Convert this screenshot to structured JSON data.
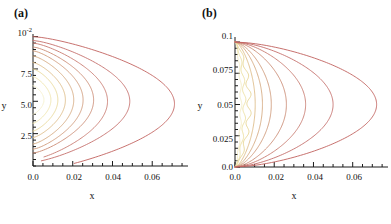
{
  "figure": {
    "panels": [
      {
        "key": "a",
        "label": "(a)",
        "xlabel": "x",
        "ylabel": "y",
        "y_exponent_label": "10",
        "y_exponent_sup": "-2",
        "x_ticks": [
          "0.0",
          "0.02",
          "0.04",
          "0.06"
        ],
        "y_ticks": [
          "7.5",
          "5.0",
          "2.5"
        ]
      },
      {
        "key": "b",
        "label": "(b)",
        "xlabel": "x",
        "ylabel": "y",
        "x_ticks": [
          "0.0",
          "0.02",
          "0.04",
          "0.06"
        ],
        "y_ticks": [
          "0.1",
          "0.075",
          "0.05",
          "0.025",
          "0.0"
        ]
      }
    ]
  },
  "chart_data": [
    {
      "type": "line",
      "title": "(a)",
      "xlabel": "x",
      "ylabel": "y",
      "xlim": [
        0.0,
        0.078
      ],
      "ylim": [
        0.0,
        0.0102
      ],
      "y_scale_note": "y axis in units of 10^-2",
      "x_ticks": [
        0.0,
        0.02,
        0.04,
        0.06
      ],
      "y_ticks": [
        0.0025,
        0.005,
        0.0075,
        0.01
      ],
      "grid": false,
      "legend": "none",
      "description": "Nested open contour curves anchored on the left axis (x=0), each bulging rightward with a rounded nose; curves grow progressively larger and change color from pale cream (innermost) to reddish brown (outermost).",
      "series": [
        {
          "name": "level-1",
          "color": "#f5efc8",
          "x_max": 0.0055,
          "y_center": 0.0051,
          "y_top": 0.0062,
          "y_bottom": 0.004
        },
        {
          "name": "level-2",
          "color": "#eee3a8",
          "x_max": 0.009,
          "y_center": 0.0051,
          "y_top": 0.0069,
          "y_bottom": 0.0033
        },
        {
          "name": "level-3",
          "color": "#e8d795",
          "x_max": 0.0125,
          "y_center": 0.0051,
          "y_top": 0.0075,
          "y_bottom": 0.0027
        },
        {
          "name": "level-4",
          "color": "#ddbb86",
          "x_max": 0.0163,
          "y_center": 0.0051,
          "y_top": 0.008,
          "y_bottom": 0.0022
        },
        {
          "name": "level-5",
          "color": "#d5a87e",
          "x_max": 0.0205,
          "y_center": 0.0051,
          "y_top": 0.0085,
          "y_bottom": 0.0017
        },
        {
          "name": "level-6",
          "color": "#cf9a79",
          "x_max": 0.0252,
          "y_center": 0.0051,
          "y_top": 0.0089,
          "y_bottom": 0.0013
        },
        {
          "name": "level-7",
          "color": "#cb8b74",
          "x_max": 0.0305,
          "y_center": 0.0051,
          "y_top": 0.0092,
          "y_bottom": 0.001
        },
        {
          "name": "level-8",
          "color": "#c87b70",
          "x_max": 0.0375,
          "y_center": 0.005,
          "y_top": 0.0095,
          "y_bottom": 0.0007
        },
        {
          "name": "level-9",
          "color": "#c56f6c",
          "x_max": 0.0487,
          "y_center": 0.005,
          "y_top": 0.0097,
          "y_bottom": 0.0004
        },
        {
          "name": "level-10",
          "color": "#c2625f",
          "x_max": 0.0712,
          "y_center": 0.0048,
          "y_top": 0.01,
          "y_bottom": 0.0002
        }
      ]
    },
    {
      "type": "line",
      "title": "(b)",
      "xlabel": "x",
      "ylabel": "y",
      "xlim": [
        0.0,
        0.078
      ],
      "ylim": [
        0.0,
        0.104
      ],
      "x_ticks": [
        0.0,
        0.02,
        0.04,
        0.06
      ],
      "y_ticks": [
        0.0,
        0.025,
        0.05,
        0.075,
        0.1
      ],
      "grid": false,
      "legend": "none",
      "description": "Nested closed-ended contour curves that all converge to two pinch points on the left axis at y=0.1 (top) and y=0 (bottom); each loop bulges rightward. Innermost curves are pale cream with a visibly wavy/jagged texture; outer curves are smooth and reddish brown.",
      "series": [
        {
          "name": "level-1",
          "color": "#f3ecc4",
          "x_max": 0.003,
          "y_top": 0.1,
          "y_bottom": 0.0,
          "wavy": true
        },
        {
          "name": "level-2",
          "color": "#ece0a2",
          "x_max": 0.0048,
          "y_top": 0.1,
          "y_bottom": 0.0,
          "wavy": true
        },
        {
          "name": "level-3",
          "color": "#e6d592",
          "x_max": 0.0072,
          "y_top": 0.1,
          "y_bottom": 0.0,
          "wavy": true
        },
        {
          "name": "level-4",
          "color": "#dcba85",
          "x_max": 0.0103,
          "y_top": 0.1,
          "y_bottom": 0.0,
          "wavy": false
        },
        {
          "name": "level-5",
          "color": "#d4a77d",
          "x_max": 0.014,
          "y_top": 0.1,
          "y_bottom": 0.0,
          "wavy": false
        },
        {
          "name": "level-6",
          "color": "#ce9978",
          "x_max": 0.0185,
          "y_top": 0.1,
          "y_bottom": 0.0,
          "wavy": false
        },
        {
          "name": "level-7",
          "color": "#ca8a73",
          "x_max": 0.0262,
          "y_top": 0.1,
          "y_bottom": 0.0,
          "wavy": false
        },
        {
          "name": "level-8",
          "color": "#c77a6f",
          "x_max": 0.036,
          "y_top": 0.1,
          "y_bottom": 0.0,
          "wavy": false
        },
        {
          "name": "level-9",
          "color": "#c46e6b",
          "x_max": 0.05,
          "y_top": 0.1,
          "y_bottom": 0.0,
          "wavy": false
        },
        {
          "name": "level-10",
          "color": "#c1615e",
          "x_max": 0.0722,
          "y_top": 0.1,
          "y_bottom": 0.0,
          "wavy": false
        }
      ]
    }
  ]
}
